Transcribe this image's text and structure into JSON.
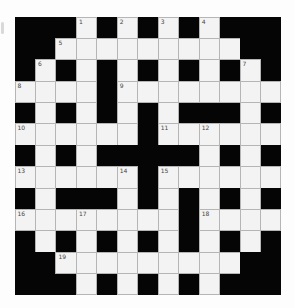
{
  "puzzle": {
    "type": "crossword",
    "rows": 13,
    "cols": 13,
    "colors": {
      "block": "#050505",
      "cell": "#f3f3f3",
      "cell_border": "#b5b5b5",
      "number": "#444444"
    },
    "grid": [
      [
        0,
        0,
        0,
        1,
        0,
        1,
        0,
        1,
        0,
        1,
        0,
        0,
        0
      ],
      [
        0,
        0,
        1,
        1,
        1,
        1,
        1,
        1,
        1,
        1,
        1,
        0,
        0
      ],
      [
        0,
        1,
        0,
        1,
        0,
        1,
        0,
        1,
        0,
        1,
        0,
        1,
        0
      ],
      [
        1,
        1,
        1,
        1,
        0,
        1,
        1,
        1,
        1,
        1,
        1,
        1,
        1
      ],
      [
        0,
        1,
        0,
        1,
        0,
        1,
        0,
        1,
        0,
        0,
        0,
        1,
        0
      ],
      [
        1,
        1,
        1,
        1,
        1,
        1,
        0,
        1,
        1,
        1,
        1,
        1,
        1
      ],
      [
        0,
        1,
        0,
        1,
        0,
        0,
        0,
        0,
        0,
        1,
        0,
        1,
        0
      ],
      [
        1,
        1,
        1,
        1,
        1,
        1,
        0,
        1,
        1,
        1,
        1,
        1,
        1
      ],
      [
        0,
        1,
        0,
        0,
        0,
        1,
        0,
        1,
        0,
        1,
        0,
        1,
        0
      ],
      [
        1,
        1,
        1,
        1,
        1,
        1,
        1,
        1,
        0,
        1,
        1,
        1,
        1
      ],
      [
        0,
        1,
        0,
        1,
        0,
        1,
        0,
        1,
        0,
        1,
        0,
        1,
        0
      ],
      [
        0,
        0,
        1,
        1,
        1,
        1,
        1,
        1,
        1,
        1,
        1,
        0,
        0
      ],
      [
        0,
        0,
        0,
        1,
        0,
        1,
        0,
        1,
        0,
        1,
        0,
        0,
        0
      ]
    ],
    "numbers": [
      {
        "row": 0,
        "col": 3,
        "label": "1"
      },
      {
        "row": 0,
        "col": 5,
        "label": "2"
      },
      {
        "row": 0,
        "col": 7,
        "label": "3"
      },
      {
        "row": 0,
        "col": 9,
        "label": "4"
      },
      {
        "row": 1,
        "col": 2,
        "label": "5"
      },
      {
        "row": 2,
        "col": 1,
        "label": "6"
      },
      {
        "row": 2,
        "col": 11,
        "label": "7"
      },
      {
        "row": 3,
        "col": 0,
        "label": "8"
      },
      {
        "row": 3,
        "col": 5,
        "label": "9"
      },
      {
        "row": 5,
        "col": 0,
        "label": "10"
      },
      {
        "row": 5,
        "col": 7,
        "label": "11"
      },
      {
        "row": 5,
        "col": 9,
        "label": "12"
      },
      {
        "row": 7,
        "col": 0,
        "label": "13"
      },
      {
        "row": 7,
        "col": 5,
        "label": "14"
      },
      {
        "row": 7,
        "col": 7,
        "label": "15"
      },
      {
        "row": 9,
        "col": 0,
        "label": "16"
      },
      {
        "row": 9,
        "col": 3,
        "label": "17"
      },
      {
        "row": 9,
        "col": 9,
        "label": "18"
      },
      {
        "row": 11,
        "col": 2,
        "label": "19"
      }
    ]
  }
}
